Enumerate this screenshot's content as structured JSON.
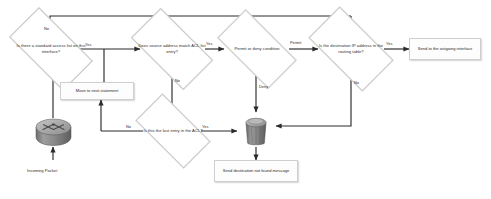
{
  "diagram": {
    "type": "flowchart",
    "nodes": {
      "standard_acl": {
        "label": "Is there a standard access list on this interface?",
        "shape": "decision"
      },
      "source_match": {
        "label": "Does source address match ACL list entry?",
        "shape": "decision"
      },
      "permit_deny": {
        "label": "Permit or deny condition",
        "shape": "decision"
      },
      "routing_table": {
        "label": "Is the destination IP address in the routing table?",
        "shape": "decision"
      },
      "outgoing": {
        "label": "Send to the outgoing interface",
        "shape": "process"
      },
      "next_stmt": {
        "label": "Move to next statement",
        "shape": "process"
      },
      "last_entry": {
        "label": "Is this the last entry in the ACL?",
        "shape": "decision"
      },
      "not_found": {
        "label": "Send destination not found message",
        "shape": "process"
      },
      "incoming": {
        "label": "Incoming Packet",
        "shape": "router-icon"
      },
      "bit_bucket": {
        "label": "",
        "shape": "bucket-icon"
      }
    },
    "edge_labels": {
      "standard_no": "No",
      "standard_yes": "Yes",
      "source_yes": "Yes",
      "source_no": "No",
      "permit": "Permit",
      "deny": "Deny",
      "routing_yes": "Yes",
      "routing_no": "No",
      "last_no": "No",
      "last_yes": "Yes"
    },
    "colors": {
      "line": "#2b2b2b",
      "node_border": "#cfcfcf",
      "node_fill": "#fdfdfd",
      "icon_body": "#8e8e8e",
      "icon_top": "#b4b4b4",
      "background": "#ffffff"
    }
  }
}
